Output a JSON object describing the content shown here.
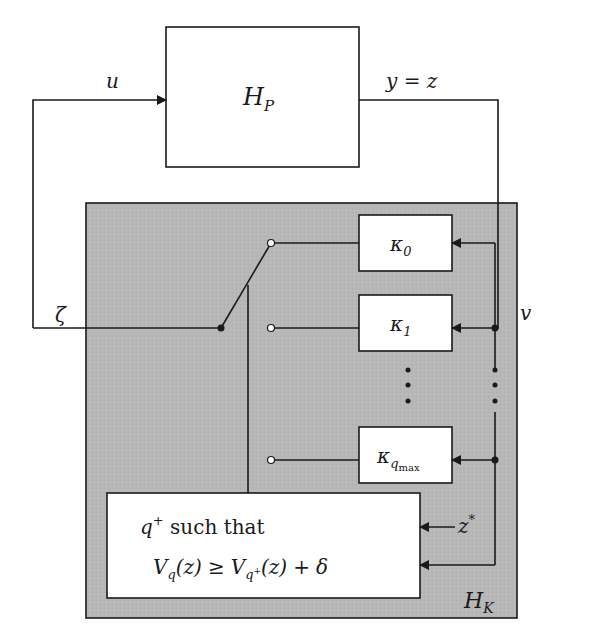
{
  "diagram": {
    "type": "switched-controller-block-diagram",
    "colors": {
      "background": "#ffffff",
      "controller_fill": "#b7b7b7",
      "stroke": "#1a1a1a",
      "open_terminal": "#ffffff"
    },
    "plant": {
      "label_main": "H",
      "label_sub": "P"
    },
    "controller": {
      "label_main": "H",
      "label_sub": "K"
    },
    "signals": {
      "input": "u",
      "output": "y = z",
      "controller_output": "ζ",
      "controller_input": "v",
      "reference": "z",
      "reference_sup": "*"
    },
    "sub_controllers": [
      {
        "main": "κ",
        "sub": "0"
      },
      {
        "main": "κ",
        "sub": "1"
      },
      {
        "main": "κ",
        "sub": "q",
        "subsub": "max"
      }
    ],
    "ellipsis": "⋮",
    "supervisor": {
      "line1_var": "q",
      "line1_sup": "+",
      "line1_text": " such that",
      "line2": {
        "lhs_main": "V",
        "lhs_sub": "q",
        "lhs_arg": "(z)",
        "relation": "≥",
        "rhs_main": "V",
        "rhs_sub": "q",
        "rhs_subsup": "+",
        "rhs_arg": "(z)",
        "plus": "+",
        "delta": "δ"
      }
    }
  }
}
